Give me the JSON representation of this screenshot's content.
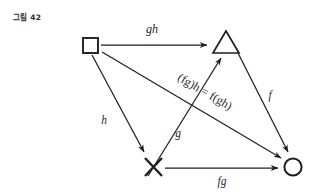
{
  "figure": {
    "caption": "그림 42",
    "background_color": "#ffffff",
    "ink_color": "#1f1f1f"
  },
  "nodes": [
    {
      "id": "square",
      "glyph": "square-node",
      "symbol": "□",
      "x": 90,
      "y": 45
    },
    {
      "id": "triangle",
      "glyph": "triangle-node",
      "symbol": "△",
      "x": 226,
      "y": 43
    },
    {
      "id": "cross",
      "glyph": "cross-node",
      "symbol": "✕",
      "x": 153,
      "y": 166
    },
    {
      "id": "circle",
      "glyph": "circle-node",
      "symbol": "○",
      "x": 293,
      "y": 166
    }
  ],
  "edges": [
    {
      "id": "square-to-triangle",
      "from": "square",
      "to": "triangle",
      "label": "gh",
      "label_x": 152,
      "label_y": 33,
      "rotate": 0
    },
    {
      "id": "square-to-cross",
      "from": "square",
      "to": "cross",
      "label": "h",
      "label_x": 104,
      "label_y": 124,
      "rotate": 0
    },
    {
      "id": "cross-to-triangle",
      "from": "cross",
      "to": "triangle",
      "label": "g",
      "label_x": 178,
      "label_y": 137,
      "rotate": 0
    },
    {
      "id": "triangle-to-circle",
      "from": "triangle",
      "to": "circle",
      "label": "f",
      "label_x": 270,
      "label_y": 99,
      "rotate": 0
    },
    {
      "id": "cross-to-circle",
      "from": "cross",
      "to": "circle",
      "label": "fg",
      "label_x": 222,
      "label_y": 184,
      "rotate": 0
    },
    {
      "id": "square-to-circle",
      "from": "square",
      "to": "circle",
      "label": "(fg)h = f(gh)",
      "label_x": 205,
      "label_y": 97,
      "rotate": 30
    }
  ],
  "equation": {
    "left": "(fg)h",
    "operator": "=",
    "right": "f(gh)",
    "full": "(fg)h = f(gh)"
  }
}
